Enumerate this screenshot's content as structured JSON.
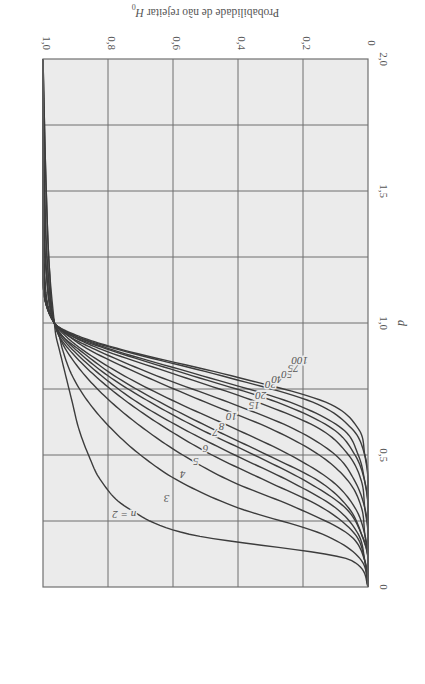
{
  "chart_data": {
    "type": "line",
    "title": "",
    "rotation_deg": 180,
    "xlabel": "d",
    "ylabel": "Probabilidade de não rejeitar H0",
    "ylabel_main": "Probabilidade de não rejeitar ",
    "ylabel_symbol": "H",
    "ylabel_subscript": "0",
    "xlim": [
      0,
      2.0
    ],
    "ylim": [
      0,
      1.0
    ],
    "x_ticks": [
      "0",
      "0,5",
      "1,0",
      "1,5",
      "2,0"
    ],
    "x_tick_values": [
      0,
      0.5,
      1.0,
      1.5,
      2.0
    ],
    "y_ticks": [
      "0",
      "0,2",
      "0,4",
      "0,6",
      "0,8",
      "1,0"
    ],
    "y_tick_values": [
      0,
      0.2,
      0.4,
      0.6,
      0.8,
      1.0
    ],
    "x_grid_values": [
      0.25,
      0.5,
      0.75,
      1.0,
      1.25,
      1.5,
      1.75
    ],
    "y_grid_values": [
      0.2,
      0.4,
      0.6,
      0.8
    ],
    "grid": true,
    "legend": "inline labels on curves",
    "x": [
      0,
      0.1,
      0.2,
      0.3,
      0.4,
      0.5,
      0.6,
      0.7,
      0.8,
      0.9,
      0.95,
      1.0,
      1.2,
      1.5,
      2.0
    ],
    "series": [
      {
        "name": "n = 2",
        "label": "n = 2",
        "values": [
          0.0,
          0.05,
          0.55,
          0.74,
          0.82,
          0.86,
          0.89,
          0.91,
          0.93,
          0.95,
          0.96,
          0.965,
          0.98,
          0.99,
          1.0
        ]
      },
      {
        "name": "n = 3",
        "label": "3",
        "values": [
          0.0,
          0.02,
          0.14,
          0.4,
          0.58,
          0.7,
          0.79,
          0.86,
          0.91,
          0.94,
          0.95,
          0.965,
          0.98,
          0.99,
          1.0
        ]
      },
      {
        "name": "n = 4",
        "label": "4",
        "values": [
          0.0,
          0.01,
          0.06,
          0.22,
          0.42,
          0.57,
          0.69,
          0.79,
          0.87,
          0.93,
          0.95,
          0.965,
          0.985,
          0.995,
          1.0
        ]
      },
      {
        "name": "n = 5",
        "label": "5",
        "values": [
          0.0,
          0.01,
          0.04,
          0.14,
          0.31,
          0.48,
          0.62,
          0.74,
          0.84,
          0.92,
          0.95,
          0.965,
          0.985,
          0.995,
          1.0
        ]
      },
      {
        "name": "n = 6",
        "label": "6",
        "values": [
          0.0,
          0.01,
          0.03,
          0.1,
          0.24,
          0.41,
          0.57,
          0.71,
          0.82,
          0.91,
          0.945,
          0.965,
          0.99,
          0.998,
          1.0
        ]
      },
      {
        "name": "n = 7",
        "label": "7",
        "values": [
          0.0,
          0.0,
          0.02,
          0.07,
          0.19,
          0.35,
          0.52,
          0.67,
          0.8,
          0.9,
          0.94,
          0.965,
          0.99,
          0.998,
          1.0
        ]
      },
      {
        "name": "n = 8",
        "label": "8",
        "values": [
          0.0,
          0.0,
          0.02,
          0.06,
          0.15,
          0.31,
          0.48,
          0.64,
          0.78,
          0.89,
          0.94,
          0.965,
          0.99,
          0.999,
          1.0
        ]
      },
      {
        "name": "n = 10",
        "label": "10",
        "values": [
          0.0,
          0.0,
          0.01,
          0.04,
          0.11,
          0.24,
          0.41,
          0.59,
          0.75,
          0.88,
          0.93,
          0.965,
          0.995,
          1.0,
          1.0
        ]
      },
      {
        "name": "n = 15",
        "label": "15",
        "values": [
          0.0,
          0.0,
          0.01,
          0.02,
          0.06,
          0.15,
          0.3,
          0.5,
          0.69,
          0.86,
          0.92,
          0.965,
          0.997,
          1.0,
          1.0
        ]
      },
      {
        "name": "n = 20",
        "label": "20",
        "values": [
          0.0,
          0.0,
          0.0,
          0.01,
          0.04,
          0.1,
          0.23,
          0.43,
          0.65,
          0.84,
          0.92,
          0.965,
          0.998,
          1.0,
          1.0
        ]
      },
      {
        "name": "n = 30",
        "label": "30",
        "values": [
          0.0,
          0.0,
          0.0,
          0.01,
          0.02,
          0.06,
          0.15,
          0.34,
          0.58,
          0.82,
          0.91,
          0.965,
          0.999,
          1.0,
          1.0
        ]
      },
      {
        "name": "n = 40",
        "label": "40",
        "values": [
          0.0,
          0.0,
          0.0,
          0.0,
          0.01,
          0.04,
          0.11,
          0.28,
          0.54,
          0.8,
          0.91,
          0.965,
          1.0,
          1.0,
          1.0
        ]
      },
      {
        "name": "n = 50",
        "label": "50",
        "values": [
          0.0,
          0.0,
          0.0,
          0.0,
          0.01,
          0.03,
          0.08,
          0.24,
          0.51,
          0.79,
          0.9,
          0.965,
          1.0,
          1.0,
          1.0
        ]
      },
      {
        "name": "n = 75",
        "label": "75",
        "values": [
          0.0,
          0.0,
          0.0,
          0.0,
          0.0,
          0.01,
          0.05,
          0.17,
          0.45,
          0.77,
          0.9,
          0.965,
          1.0,
          1.0,
          1.0
        ]
      },
      {
        "name": "n = 100",
        "label": "100",
        "values": [
          0.0,
          0.0,
          0.0,
          0.0,
          0.0,
          0.01,
          0.03,
          0.13,
          0.42,
          0.76,
          0.89,
          0.965,
          1.0,
          1.0,
          1.0
        ]
      }
    ],
    "curve_label_positions": [
      {
        "label": "n = 2",
        "d": 0.28,
        "p": 0.75
      },
      {
        "label": "3",
        "d": 0.34,
        "p": 0.62
      },
      {
        "label": "4",
        "d": 0.43,
        "p": 0.57
      },
      {
        "label": "5",
        "d": 0.48,
        "p": 0.53
      },
      {
        "label": "6",
        "d": 0.53,
        "p": 0.5
      },
      {
        "label": "7",
        "d": 0.59,
        "p": 0.47
      },
      {
        "label": "8",
        "d": 0.61,
        "p": 0.45
      },
      {
        "label": "10",
        "d": 0.65,
        "p": 0.42
      },
      {
        "label": "15",
        "d": 0.69,
        "p": 0.35
      },
      {
        "label": "20",
        "d": 0.73,
        "p": 0.33
      },
      {
        "label": "30",
        "d": 0.77,
        "p": 0.3
      },
      {
        "label": "40",
        "d": 0.79,
        "p": 0.28
      },
      {
        "label": "50",
        "d": 0.81,
        "p": 0.25
      },
      {
        "label": "75",
        "d": 0.83,
        "p": 0.23
      },
      {
        "label": "100",
        "d": 0.86,
        "p": 0.21
      }
    ]
  },
  "colors": {
    "plot_background": "#ebebeb",
    "grid": "#6e6e6e",
    "curve": "#3c3c3c",
    "text": "#555555",
    "frame": "#707070"
  }
}
